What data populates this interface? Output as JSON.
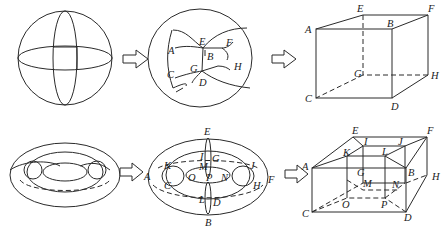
{
  "colors": {
    "line": "#2a2a2a",
    "background": "#ffffff",
    "label": "#222222"
  },
  "rows": [
    {
      "name": "sphere-row",
      "panels": [
        {
          "name": "sphere",
          "labels": []
        },
        {
          "name": "sphere-partitioned",
          "labels": [
            "A",
            "E",
            "F",
            "B",
            "G",
            "H",
            "C",
            "D"
          ]
        },
        {
          "name": "cube",
          "labels": [
            "A",
            "E",
            "B",
            "F",
            "G",
            "H",
            "C",
            "D"
          ]
        }
      ]
    },
    {
      "name": "torus-row",
      "panels": [
        {
          "name": "torus",
          "labels": []
        },
        {
          "name": "torus-partitioned",
          "labels": [
            "E",
            "K",
            "I",
            "G",
            "J",
            "A",
            "M",
            "C",
            "O",
            "P",
            "N",
            "H",
            "F",
            "L",
            "D",
            "B"
          ]
        },
        {
          "name": "frame-box",
          "labels": [
            "E",
            "I",
            "J",
            "F",
            "K",
            "L",
            "A",
            "G",
            "B",
            "H",
            "M",
            "N",
            "C",
            "O",
            "P",
            "D"
          ]
        }
      ]
    }
  ],
  "arrows": {
    "count": 4,
    "symbol": "hollow-right-arrow"
  }
}
